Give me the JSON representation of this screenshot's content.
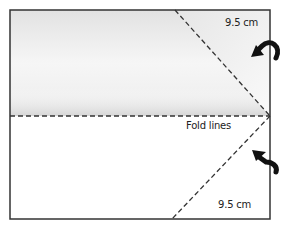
{
  "diagram": {
    "type": "folding-instructions",
    "labels": {
      "top_measure": "9.5 cm",
      "bottom_measure": "9.5 cm",
      "fold_lines": "Fold lines"
    },
    "arrows": [
      {
        "name": "fold-arrow-top",
        "direction": "down-left",
        "meaning": "fold top corner inward"
      },
      {
        "name": "fold-arrow-bottom",
        "direction": "up-left",
        "meaning": "fold bottom corner inward"
      }
    ],
    "colors": {
      "outline": "#333333",
      "dashed_line": "#333333",
      "shading": "#d8d8d8",
      "arrow": "#111111"
    }
  }
}
